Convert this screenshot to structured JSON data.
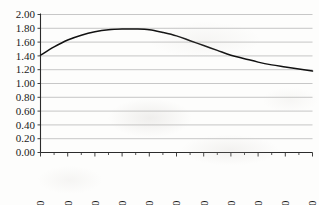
{
  "chart_data": {
    "type": "line",
    "title": "",
    "subtitle": "",
    "xlabel": "",
    "ylabel": "",
    "grid": "horizontal",
    "legend": "none",
    "xlim": [
      2000,
      2100
    ],
    "ylim": [
      0.0,
      2.0
    ],
    "x_tick_step": 10,
    "x_minor_tick_step": 5,
    "y_tick_step": 0.2,
    "x_tick_labels": [
      "2000",
      "2010",
      "2020",
      "2030",
      "2040",
      "2050",
      "2060",
      "2070",
      "2080",
      "2090",
      "2100"
    ],
    "y_tick_labels": [
      "0.00",
      "0.20",
      "0.40",
      "0.60",
      "0.80",
      "1.00",
      "1.20",
      "1.40",
      "1.60",
      "1.80",
      "2.00"
    ],
    "x": [
      2000,
      2005,
      2010,
      2015,
      2020,
      2025,
      2030,
      2035,
      2040,
      2045,
      2050,
      2055,
      2060,
      2065,
      2070,
      2075,
      2080,
      2085,
      2090,
      2095,
      2100
    ],
    "series": [
      {
        "name": "Total fertility rate",
        "color": "#111111",
        "values": [
          1.41,
          1.53,
          1.63,
          1.7,
          1.75,
          1.78,
          1.79,
          1.79,
          1.78,
          1.74,
          1.69,
          1.62,
          1.55,
          1.48,
          1.41,
          1.36,
          1.31,
          1.27,
          1.24,
          1.21,
          1.18
        ]
      }
    ],
    "annotations": []
  },
  "axis_style": {
    "gridline_color": "#b9b9b9",
    "axis_color": "#2b2b2b",
    "label_color": "#1a1a1a",
    "x_label_rotation": "-90"
  }
}
